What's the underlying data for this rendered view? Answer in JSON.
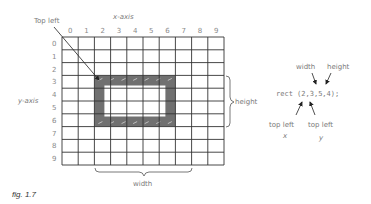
{
  "diagram": {
    "x_axis_label": "x-axis",
    "y_axis_label": "y-axis",
    "x_ticks": [
      "0",
      "1",
      "2",
      "3",
      "4",
      "5",
      "6",
      "7",
      "8",
      "9"
    ],
    "y_ticks": [
      "0",
      "1",
      "2",
      "3",
      "4",
      "5",
      "6",
      "7",
      "8",
      "9"
    ],
    "grid": {
      "cols": 10,
      "rows": 10
    },
    "rect": {
      "x": 2,
      "y": 3,
      "width": 5,
      "height": 4,
      "color": "#707070"
    },
    "top_left_label": "Top left",
    "width_label": "width",
    "height_label": "height",
    "code": {
      "text": "rect (2,3,5,4);",
      "width_label": "width",
      "height_label": "height",
      "top_left_x_label": "top left",
      "top_left_x_var": "x",
      "top_left_y_label": "top left",
      "top_left_y_var": "y"
    },
    "caption": "fig. 1.7"
  }
}
